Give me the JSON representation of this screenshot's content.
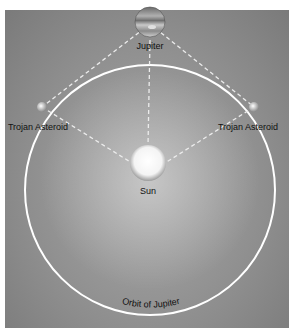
{
  "diagram": {
    "labels": {
      "jupiter": "Jupiter",
      "trojan_left": "Trojan Asteroid",
      "trojan_right": "Trojan Asteroid",
      "sun": "Sun",
      "orbit": "Orbit of Jupiter"
    },
    "colors": {
      "background": "#8e8e8e",
      "orbit": "#ffffff",
      "dashes": "#e8e8e8",
      "text": "#111111"
    }
  }
}
